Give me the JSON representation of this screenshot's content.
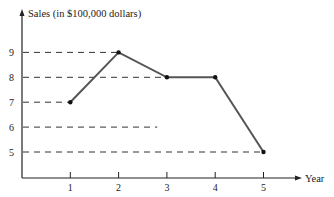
{
  "chart_data": {
    "type": "line",
    "title": "",
    "xlabel": "Year",
    "ylabel": "Sales (in $100,000 dollars)",
    "x": [
      1,
      2,
      3,
      4,
      5
    ],
    "categories": [
      "1",
      "2",
      "3",
      "4",
      "5"
    ],
    "series": [
      {
        "name": "Sales",
        "values": [
          7,
          9,
          8,
          8,
          5
        ]
      }
    ],
    "x_ticks": [
      "1",
      "2",
      "3",
      "4",
      "5"
    ],
    "y_ticks": [
      "5",
      "6",
      "7",
      "8",
      "9"
    ],
    "xlim": [
      0,
      5.5
    ],
    "ylim": [
      4,
      10
    ],
    "grid": false,
    "reference_lines": [
      {
        "y": 9,
        "to_x": 2
      },
      {
        "y": 8,
        "to_x": 3
      },
      {
        "y": 7,
        "to_x": 1
      },
      {
        "y": 6,
        "to_x": 2.8
      },
      {
        "y": 5,
        "to_x": 5
      }
    ],
    "legend": "none",
    "line_color": "#555555",
    "marker_color": "#111111"
  }
}
